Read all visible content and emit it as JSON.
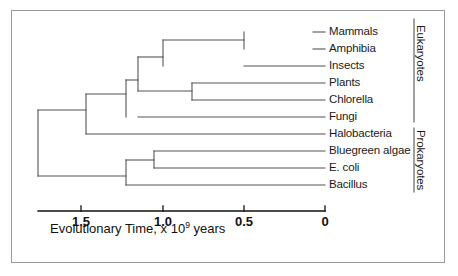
{
  "figure": {
    "kind": "phylogenetic-tree-diagram",
    "line_color": "#555555",
    "text_color": "#1a1a1a",
    "border_color": "#9a9a9a"
  },
  "leaves": [
    {
      "label": "Mammals",
      "y": 32,
      "branch_x": 313
    },
    {
      "label": "Amphibia",
      "y": 49,
      "branch_x": 313
    },
    {
      "label": "Insects",
      "y": 66,
      "branch_x": 244
    },
    {
      "label": "Plants",
      "y": 83,
      "branch_x": 192
    },
    {
      "label": "Chlorella",
      "y": 100,
      "branch_x": 192
    },
    {
      "label": "Fungi",
      "y": 117,
      "branch_x": 138
    },
    {
      "label": "Halobacteria",
      "y": 134,
      "branch_x": 86
    },
    {
      "label": "Bluegreen algae",
      "y": 151,
      "branch_x": 154
    },
    {
      "label": "E. coli",
      "y": 168,
      "branch_x": 154
    },
    {
      "label": "Bacillus",
      "y": 185,
      "branch_x": 126
    }
  ],
  "internal_nodes": [
    {
      "name": "root",
      "x": 38,
      "y_top": 110,
      "y_bottom": 176
    },
    {
      "name": "eukaryote-node",
      "x": 86,
      "y_top": 94,
      "y_bottom": 134
    },
    {
      "name": "crown-eukaryote",
      "x": 126,
      "y_top": 80,
      "y_bottom": 117
    },
    {
      "name": "animal-plant-node",
      "x": 138,
      "y_top": 57,
      "y_bottom": 91
    },
    {
      "name": "animal-node",
      "x": 163,
      "y_top": 40,
      "y_bottom": 66
    },
    {
      "name": "vertebrate-node",
      "x": 244,
      "y_top": 32,
      "y_bottom": 49
    },
    {
      "name": "plant-node",
      "x": 192,
      "y_top": 83,
      "y_bottom": 100
    },
    {
      "name": "prokaryote-node",
      "x": 126,
      "y_top": 160,
      "y_bottom": 185
    },
    {
      "name": "bacteria-node",
      "x": 154,
      "y_top": 151,
      "y_bottom": 168
    }
  ],
  "groups": [
    {
      "label": "Eukaryotes",
      "line_x": 414,
      "y_start": 19,
      "y_end": 122,
      "text_y": 25
    },
    {
      "label": "Prokaryotes",
      "line_x": 414,
      "y_start": 128,
      "y_end": 192,
      "text_y": 130
    }
  ],
  "axis": {
    "line_x_start": 38,
    "line_x_end": 325,
    "line_y": 211,
    "tick_length": 5,
    "ticks": [
      {
        "label": "1.5",
        "x": 81
      },
      {
        "label": "1.0",
        "x": 163
      },
      {
        "label": "0.5",
        "x": 244
      },
      {
        "label": "0",
        "x": 325
      }
    ],
    "title_prefix": "Evolutionary Time, x 10",
    "title_exponent": "9",
    "title_suffix": " years"
  }
}
